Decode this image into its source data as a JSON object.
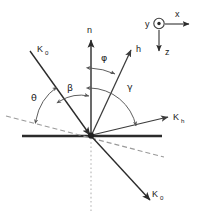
{
  "figure": {
    "type": "vector-geometry-diagram",
    "background_color": "#ffffff",
    "line_color": "#3b3b3b",
    "surface_color": "#2b2b2b",
    "dashed_color": "#9a9a9a"
  },
  "vectors": {
    "incident": {
      "symbol": "K",
      "subscript": "0",
      "label": "K0"
    },
    "transmitted": {
      "symbol": "K",
      "subscript": "0",
      "label": "K0"
    },
    "diffracted": {
      "symbol": "K",
      "subscript": "h",
      "label": "Kh"
    },
    "reciprocal": {
      "symbol": "h",
      "subscript": "",
      "label": "h"
    },
    "normal": {
      "symbol": "n",
      "subscript": "",
      "label": "n"
    }
  },
  "angles": {
    "theta": "θ",
    "beta": "β",
    "phi": "φ",
    "gamma": "γ"
  },
  "coordinate_inset": {
    "x_axis": "x",
    "y_axis": "y",
    "z_axis": "z",
    "y_symbol": "out-of-page-dot"
  }
}
